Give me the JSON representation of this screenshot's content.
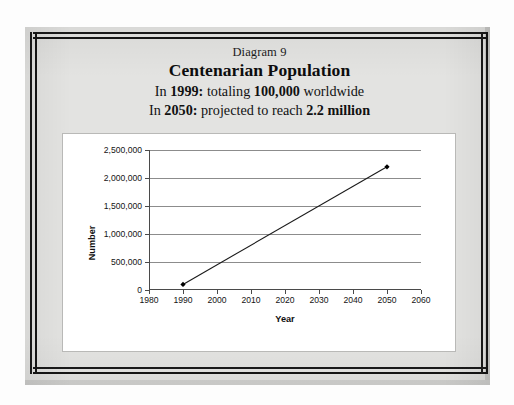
{
  "slide": {
    "diagram_label": "Diagram 9",
    "title": "Centenarian Population",
    "subtitle_line_1_prefix": "In ",
    "subtitle_line_1_year": "1999:",
    "subtitle_line_1_mid": "  totaling ",
    "subtitle_line_1_value": "100,000",
    "subtitle_line_1_suffix": " worldwide",
    "subtitle_line_2_prefix": "In ",
    "subtitle_line_2_year": "2050:",
    "subtitle_line_2_mid": "  projected to reach ",
    "subtitle_line_2_value": "2.2 million",
    "subtitle_line_2_suffix": "",
    "background_color": "#e3e3e1",
    "border_color": "#151515"
  },
  "chart_data": {
    "type": "line",
    "title": "",
    "xlabel": "Year",
    "ylabel": "Number",
    "x": [
      1990,
      2050
    ],
    "values": [
      100000,
      2200000
    ],
    "series": [
      {
        "name": "Centenarian Population",
        "points": [
          {
            "x": 1990,
            "y": 100000
          },
          {
            "x": 2050,
            "y": 2200000
          }
        ]
      }
    ],
    "xlim": [
      1980,
      2060
    ],
    "ylim": [
      0,
      2500000
    ],
    "xticks": [
      1980,
      1990,
      2000,
      2010,
      2020,
      2030,
      2040,
      2050,
      2060
    ],
    "xtick_labels": [
      "1980",
      "1990",
      "2000",
      "2010",
      "2020",
      "2030",
      "2040",
      "2050",
      "2060"
    ],
    "yticks": [
      0,
      500000,
      1000000,
      1500000,
      2000000,
      2500000
    ],
    "ytick_labels": [
      "0",
      "500,000",
      "1,000,000",
      "1,500,000",
      "2,000,000",
      "2,500,000"
    ],
    "grid": "horizontal",
    "legend": "none",
    "line_color": "#1a1a1a",
    "marker": "diamond",
    "marker_color": "#000000",
    "plot_background": "#ffffff"
  }
}
